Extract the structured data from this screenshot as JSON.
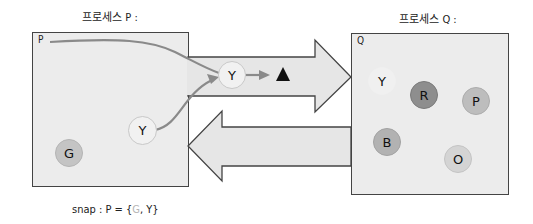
{
  "process_p": {
    "title": "프로세스 P :",
    "corner_label": "P",
    "marbles": [
      {
        "label": "Y",
        "color": "#f1f1f1",
        "border": "#c8c8c8"
      },
      {
        "label": "G",
        "color": "#c4c4c4",
        "border": "#b4b4b4"
      }
    ]
  },
  "process_q": {
    "title": "프로세스 Q :",
    "corner_label": "Q",
    "marbles": [
      {
        "label": "Y",
        "color": "#f0f0f0",
        "border": "#f0f0f0"
      },
      {
        "label": "R",
        "color": "#8e8e8e",
        "border": "#7a7a7a"
      },
      {
        "label": "P",
        "color": "#bdbdbd",
        "border": "#acacac"
      },
      {
        "label": "B",
        "color": "#b2b2b2",
        "border": "#a2a2a2"
      },
      {
        "label": "O",
        "color": "#d4d4d4",
        "border": "#c4c4c4"
      }
    ]
  },
  "channel": {
    "in_transit_marble": {
      "label": "Y",
      "color": "#f1f1f1",
      "border": "#c8c8c8"
    },
    "marker_icon": "black-triangle"
  },
  "snapshot": {
    "prefix": "snap : P = {",
    "dim_item": "G",
    "separator": ", ",
    "item": "Y",
    "suffix": "}"
  },
  "colors": {
    "box_fill": "#ececec",
    "arrow_fill": "#e6e6e6",
    "outline": "#444444",
    "path_line": "#8a8a8a"
  }
}
